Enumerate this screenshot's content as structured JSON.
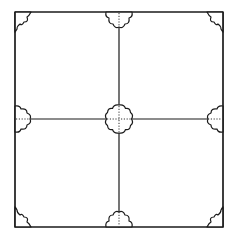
{
  "diagram": {
    "type": "tile-pattern",
    "colors": {
      "background": "#ffffff",
      "line": "#1a1a1a",
      "dotted": "#333333"
    },
    "frame": {
      "x1": 15,
      "y1": 12,
      "x2": 223,
      "y2": 227
    },
    "divider": {
      "cx": 119,
      "cy": 119
    },
    "motifs": {
      "center": {
        "kind": "full-rosette",
        "lobes": 8,
        "radius": 12
      },
      "edges": [
        {
          "position": "top",
          "kind": "half-rosette",
          "lobes": 3
        },
        {
          "position": "bottom",
          "kind": "half-rosette",
          "lobes": 3
        },
        {
          "position": "left",
          "kind": "half-rosette",
          "lobes": 3
        },
        {
          "position": "right",
          "kind": "half-rosette",
          "lobes": 3
        }
      ],
      "corners": [
        {
          "position": "top-left",
          "kind": "quarter-rosette",
          "lobes": 2
        },
        {
          "position": "top-right",
          "kind": "quarter-rosette",
          "lobes": 2
        },
        {
          "position": "bottom-left",
          "kind": "quarter-rosette",
          "lobes": 2
        },
        {
          "position": "bottom-right",
          "kind": "quarter-rosette",
          "lobes": 2
        }
      ]
    }
  }
}
